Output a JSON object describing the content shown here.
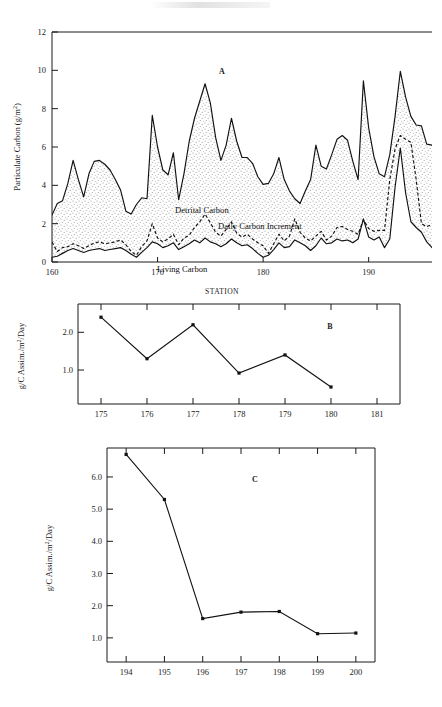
{
  "figure": {
    "panels": [
      "A",
      "B",
      "C"
    ],
    "shared_xaxis_title": "STATION"
  },
  "panel_a": {
    "letter": "A",
    "ylabel": "Particulate Carbon (g/m",
    "ylabel_exp": "2",
    "ylabel_tail": ")",
    "xlabel": "STATION",
    "annotations": {
      "detrital": "Detrital Carbon",
      "increment": "Daily Carbon Increment",
      "living": "Living Carbon"
    }
  },
  "panel_b": {
    "letter": "B",
    "ylabel_head": "g/C Assim./m",
    "ylabel_exp": "2",
    "ylabel_tail": "/Day"
  },
  "panel_c": {
    "letter": "C",
    "ylabel_head": "g/C Assim./m",
    "ylabel_exp": "2",
    "ylabel_tail": "/Day"
  },
  "colors": {
    "ink": "#111111",
    "fill_stipple": "#efefef",
    "background": "#ffffff"
  },
  "chart_data": [
    {
      "id": "A",
      "type": "area",
      "title": "A",
      "xlabel": "STATION",
      "ylabel": "Particulate Carbon (g/m2)",
      "xlim": [
        160,
        196
      ],
      "ylim": [
        0,
        12
      ],
      "yticks": [
        0,
        2,
        4,
        6,
        8,
        10,
        12
      ],
      "xticks": [
        160,
        170,
        180,
        190
      ],
      "grid": false,
      "legend": "inline annotations",
      "annotations": [
        "Detrital Carbon",
        "Daily Carbon Increment",
        "Living Carbon"
      ],
      "x": [
        160.0,
        160.5,
        161.0,
        161.5,
        162.0,
        162.5,
        163.0,
        163.5,
        164.0,
        164.5,
        165.0,
        165.5,
        166.0,
        166.5,
        167.0,
        167.5,
        168.0,
        168.5,
        169.0,
        169.5,
        170.0,
        170.5,
        171.0,
        171.5,
        172.0,
        172.5,
        173.0,
        173.5,
        174.0,
        174.5,
        175.0,
        175.5,
        176.0,
        176.5,
        177.0,
        177.5,
        178.0,
        178.5,
        179.0,
        179.5,
        180.0,
        180.5,
        181.0,
        181.5,
        182.0,
        182.5,
        183.0,
        183.5,
        184.0,
        184.5,
        185.0,
        185.5,
        186.0,
        186.5,
        187.0,
        187.5,
        188.0,
        188.5,
        189.0,
        189.5,
        190.0,
        190.5,
        191.0,
        191.5,
        192.0,
        192.5,
        193.0,
        193.5,
        194.0,
        194.5,
        195.0,
        195.5,
        196.0
      ],
      "series": [
        {
          "name": "Total Particulate Carbon",
          "style": "solid",
          "values": [
            2.45,
            3.05,
            3.2,
            4.1,
            5.3,
            4.3,
            3.4,
            4.6,
            5.25,
            5.3,
            5.1,
            4.8,
            4.3,
            3.75,
            2.65,
            2.5,
            3.0,
            3.35,
            3.3,
            7.65,
            6.0,
            4.8,
            4.55,
            5.7,
            3.25,
            4.6,
            6.3,
            7.5,
            8.4,
            9.3,
            8.3,
            6.5,
            5.3,
            6.1,
            7.5,
            6.3,
            5.45,
            5.45,
            5.15,
            4.45,
            4.05,
            4.1,
            4.6,
            5.45,
            4.3,
            3.7,
            3.3,
            3.05,
            3.7,
            4.3,
            6.1,
            5.0,
            4.85,
            5.6,
            6.4,
            6.6,
            6.35,
            5.25,
            4.3,
            9.45,
            7.0,
            5.5,
            4.6,
            4.45,
            5.6,
            7.6,
            9.95,
            8.6,
            7.6,
            7.15,
            7.1,
            6.15,
            6.1
          ]
        },
        {
          "name": "Daily Carbon Increment",
          "style": "dashed",
          "values": [
            1.05,
            0.55,
            0.75,
            0.8,
            0.95,
            0.85,
            0.7,
            0.85,
            1.0,
            1.05,
            0.95,
            1.0,
            1.05,
            1.15,
            0.9,
            0.55,
            0.35,
            0.8,
            1.1,
            2.0,
            1.25,
            1.05,
            1.2,
            1.45,
            0.9,
            1.25,
            1.4,
            1.8,
            2.1,
            2.5,
            2.05,
            1.55,
            1.35,
            1.7,
            2.1,
            1.5,
            1.3,
            1.45,
            1.2,
            1.0,
            0.85,
            0.45,
            0.95,
            1.45,
            1.1,
            1.35,
            2.25,
            1.55,
            1.25,
            1.1,
            1.35,
            1.6,
            1.15,
            1.35,
            1.8,
            1.85,
            1.7,
            1.6,
            1.45,
            2.2,
            1.75,
            1.6,
            1.65,
            1.65,
            4.3,
            5.9,
            6.6,
            6.4,
            6.25,
            4.3,
            2.0,
            1.85,
            1.95
          ]
        },
        {
          "name": "Living Carbon",
          "style": "solid-lower",
          "values": [
            0.25,
            0.3,
            0.45,
            0.6,
            0.7,
            0.6,
            0.5,
            0.6,
            0.65,
            0.7,
            0.6,
            0.65,
            0.7,
            0.75,
            0.6,
            0.4,
            0.25,
            0.5,
            0.75,
            1.05,
            0.95,
            0.75,
            0.85,
            1.0,
            0.65,
            0.8,
            0.95,
            1.15,
            1.0,
            1.25,
            1.05,
            0.95,
            0.8,
            0.95,
            1.2,
            1.0,
            0.85,
            0.9,
            0.7,
            0.45,
            0.25,
            0.35,
            0.65,
            1.0,
            0.75,
            0.8,
            1.15,
            1.0,
            0.85,
            0.6,
            0.85,
            1.25,
            0.95,
            1.0,
            1.2,
            1.1,
            1.15,
            1.0,
            1.2,
            2.25,
            1.3,
            1.15,
            1.3,
            0.75,
            1.2,
            3.9,
            5.95,
            3.6,
            2.1,
            1.8,
            1.55,
            1.05,
            0.75
          ]
        }
      ]
    },
    {
      "id": "B",
      "type": "line",
      "title": "B",
      "xlabel": "",
      "ylabel": "g/C Assim./m2/Day",
      "xlim": [
        174.5,
        181.5
      ],
      "ylim": [
        0.1,
        2.75
      ],
      "yticks": [
        1.0,
        2.0
      ],
      "ytick_labels": [
        "1.0",
        "2.0"
      ],
      "xticks": [
        175,
        176,
        177,
        178,
        179,
        180,
        181
      ],
      "grid": false,
      "categories": [
        175,
        176,
        177,
        178,
        179,
        180
      ],
      "values": [
        2.4,
        1.3,
        2.2,
        0.92,
        1.4,
        0.55
      ]
    },
    {
      "id": "C",
      "type": "line",
      "title": "C",
      "xlabel": "",
      "ylabel": "g/C Assim./m2/Day",
      "xlim": [
        193.5,
        200.5
      ],
      "ylim": [
        0.25,
        6.9
      ],
      "yticks": [
        1.0,
        2.0,
        3.0,
        4.0,
        5.0,
        6.0
      ],
      "ytick_labels": [
        "1.0",
        "2.0",
        "3.0",
        "4.0",
        "5.0",
        "6.0"
      ],
      "xticks": [
        194,
        195,
        196,
        197,
        198,
        199,
        200
      ],
      "grid": false,
      "categories": [
        194,
        195,
        196,
        197,
        198,
        199,
        200
      ],
      "values": [
        6.7,
        5.3,
        1.6,
        1.8,
        1.82,
        1.13,
        1.15
      ]
    }
  ]
}
